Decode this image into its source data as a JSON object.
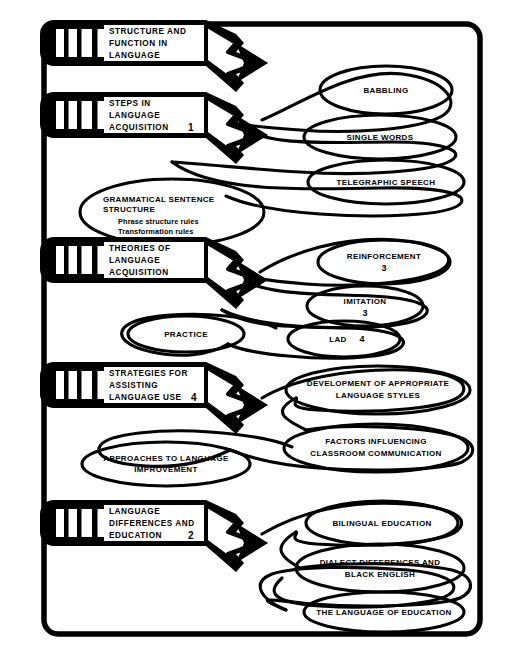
{
  "diagram": {
    "ink_color": "#000000",
    "background_color": "#ffffff",
    "frame": {
      "shape": "rounded-rectangle"
    }
  },
  "pencils": [
    {
      "id": "structure-and-function-in-language",
      "lines": [
        "STRUCTURE AND",
        "FUNCTION IN",
        "LANGUAGE"
      ],
      "number": ""
    },
    {
      "id": "steps-in-language-acquisition",
      "lines": [
        "STEPS IN",
        "LANGUAGE",
        "ACQUISITION"
      ],
      "number": "1"
    },
    {
      "id": "theories-of-language-acquisition",
      "lines": [
        "THEORIES OF",
        "LANGUAGE",
        "ACQUISITION"
      ],
      "number": ""
    },
    {
      "id": "strategies-for-assisting-language-use",
      "lines": [
        "STRATEGIES FOR",
        "ASSISTING",
        "LANGUAGE USE"
      ],
      "number": "4"
    },
    {
      "id": "language-differences-and-education",
      "lines": [
        "LANGUAGE",
        "DIFFERENCES AND",
        "EDUCATION"
      ],
      "number": "2"
    }
  ],
  "bubbles": {
    "babbling": {
      "lines": [
        "BABBLING"
      ],
      "number": ""
    },
    "single_words": {
      "lines": [
        "SINGLE WORDS"
      ],
      "number": ""
    },
    "telegraphic_speech": {
      "lines": [
        "TELEGRAPHIC SPEECH"
      ],
      "number": ""
    },
    "grammatical": {
      "heading": [
        "GRAMMATICAL SENTENCE",
        "STRUCTURE"
      ],
      "sub": [
        "Phrase structure rules",
        "Transformation rules"
      ]
    },
    "reinforcement": {
      "lines": [
        "REINFORCEMENT"
      ],
      "number": "3"
    },
    "imitation": {
      "lines": [
        "IMITATION"
      ],
      "number": "3"
    },
    "lad": {
      "lines": [
        "LAD"
      ],
      "number": "4"
    },
    "practice": {
      "lines": [
        "PRACTICE"
      ],
      "number": ""
    },
    "development_styles": {
      "lines": [
        "DEVELOPMENT OF APPROPRIATE",
        "LANGUAGE STYLES"
      ],
      "number": ""
    },
    "factors_classroom": {
      "lines": [
        "FACTORS INFLUENCING",
        "CLASSROOM COMMUNICATION"
      ],
      "number": ""
    },
    "approaches_improvement": {
      "lines": [
        "APPROACHES TO LANGUAGE",
        "IMPROVEMENT"
      ],
      "number": ""
    },
    "bilingual_education": {
      "lines": [
        "BILINGUAL EDUCATION"
      ],
      "number": ""
    },
    "dialect_black_english": {
      "lines": [
        "DIALECT DIFFERENCES AND",
        "BLACK ENGLISH"
      ],
      "number": ""
    },
    "language_of_education": {
      "lines": [
        "THE LANGUAGE OF EDUCATION"
      ],
      "number": ""
    }
  }
}
